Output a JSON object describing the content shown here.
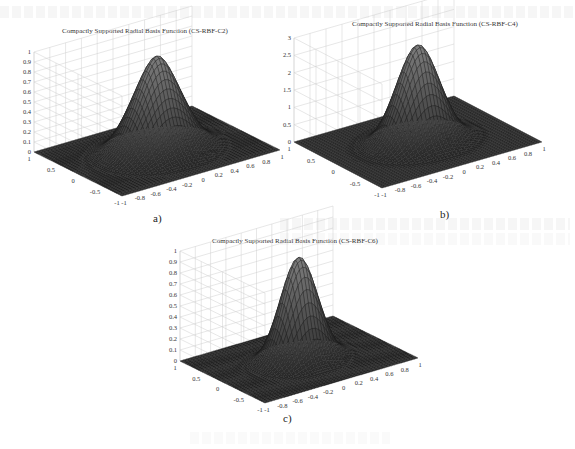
{
  "figure": {
    "panels": [
      {
        "id": "a",
        "title": "Compactly Supported Radial Basis Function (CS-RBF-C2)",
        "caption": "a)",
        "z_ticks": [
          "0",
          "0.1",
          "0.2",
          "0.3",
          "0.4",
          "0.5",
          "0.6",
          "0.7",
          "0.8",
          "0.9",
          "1"
        ],
        "x_ticks": [
          "-1",
          "-0.8",
          "-0.6",
          "-0.4",
          "-0.2",
          "0",
          "0.2",
          "0.4",
          "0.6",
          "0.8",
          "1"
        ],
        "y_ticks": [
          "-1",
          "-0.5",
          "0",
          "0.5",
          "1"
        ]
      },
      {
        "id": "b",
        "title": "Compactly Supported Radial Basis Function (CS-RBF-C4)",
        "caption": "b)",
        "z_ticks": [
          "0",
          "0.5",
          "1",
          "1.5",
          "2",
          "2.5",
          "3"
        ],
        "x_ticks": [
          "-1",
          "-0.8",
          "-0.6",
          "-0.4",
          "-0.2",
          "0",
          "0.2",
          "0.4",
          "0.6",
          "0.8",
          "1"
        ],
        "y_ticks": [
          "-1",
          "-0.5",
          "0",
          "0.5",
          "1"
        ]
      },
      {
        "id": "c",
        "title": "Compactly Supported Radial Basis Function (CS-RBF-C6)",
        "caption": "c)",
        "z_ticks": [
          "0",
          "0.1",
          "0.2",
          "0.3",
          "0.4",
          "0.5",
          "0.6",
          "0.7",
          "0.8",
          "0.9",
          "1"
        ],
        "x_ticks": [
          "-1",
          "-0.8",
          "-0.6",
          "-0.4",
          "-0.2",
          "0",
          "0.2",
          "0.4",
          "0.6",
          "0.8",
          "1"
        ],
        "y_ticks": [
          "-1",
          "-0.5",
          "0",
          "0.5",
          "1"
        ]
      }
    ]
  },
  "chart_data": [
    {
      "type": "surface",
      "title": "Compactly Supported Radial Basis Function (CS-RBF-C2)",
      "xlabel": "",
      "ylabel": "",
      "zlabel": "",
      "xlim": [
        -1,
        1
      ],
      "ylim": [
        -1,
        1
      ],
      "zlim": [
        0,
        1
      ],
      "z_ticks": [
        0,
        0.1,
        0.2,
        0.3,
        0.4,
        0.5,
        0.6,
        0.7,
        0.8,
        0.9,
        1
      ],
      "peak": {
        "x": 0,
        "y": 0,
        "z": 0.95
      },
      "support_radius": 1,
      "grid": true,
      "colormap": "grayscale mesh"
    },
    {
      "type": "surface",
      "title": "Compactly Supported Radial Basis Function (CS-RBF-C4)",
      "xlabel": "",
      "ylabel": "",
      "zlabel": "",
      "xlim": [
        -1,
        1
      ],
      "ylim": [
        -1,
        1
      ],
      "zlim": [
        0,
        3
      ],
      "z_ticks": [
        0,
        0.5,
        1,
        1.5,
        2,
        2.5,
        3
      ],
      "peak": {
        "x": 0,
        "y": 0,
        "z": 2.8
      },
      "support_radius": 1,
      "grid": true,
      "colormap": "grayscale mesh"
    },
    {
      "type": "surface",
      "title": "Compactly Supported Radial Basis Function (CS-RBF-C6)",
      "xlabel": "",
      "ylabel": "",
      "zlabel": "",
      "xlim": [
        -1,
        1
      ],
      "ylim": [
        -1,
        1
      ],
      "zlim": [
        0,
        1
      ],
      "z_ticks": [
        0,
        0.1,
        0.2,
        0.3,
        0.4,
        0.5,
        0.6,
        0.7,
        0.8,
        0.9,
        1
      ],
      "peak": {
        "x": 0,
        "y": 0,
        "z": 0.93
      },
      "support_radius": 1,
      "grid": true,
      "colormap": "grayscale mesh"
    }
  ]
}
